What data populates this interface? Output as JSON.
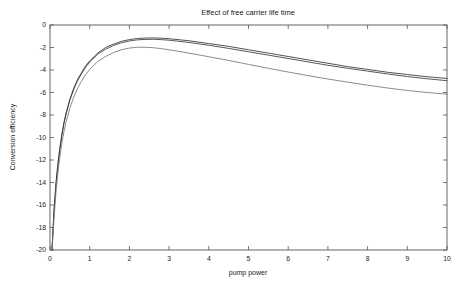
{
  "chart_data": {
    "type": "line",
    "title": "Effect of free carrier life time",
    "xlabel": "pump power",
    "ylabel": "Conversion efficiency",
    "xlim": [
      0,
      10
    ],
    "ylim": [
      -20,
      0
    ],
    "xticks": [
      0,
      1,
      2,
      3,
      4,
      5,
      6,
      7,
      8,
      9,
      10
    ],
    "yticks": [
      0,
      -2,
      -4,
      -6,
      -8,
      -10,
      -12,
      -14,
      -16,
      -18,
      -20
    ],
    "xticklabels": [
      "0",
      "1",
      "2",
      "3",
      "4",
      "5",
      "6",
      "7",
      "8",
      "9",
      "10"
    ],
    "yticklabels": [
      "0",
      "-2",
      "-4",
      "-6",
      "-8",
      "-10",
      "-12",
      "-14",
      "-16",
      "-18",
      "-20"
    ],
    "grid": false,
    "legend": false,
    "legend_position": "none",
    "background_color": "#ffffff",
    "frame_color": "#555555",
    "x": [
      0.05,
      0.1,
      0.15,
      0.2,
      0.25,
      0.3,
      0.35,
      0.4,
      0.5,
      0.6,
      0.7,
      0.8,
      0.9,
      1.0,
      1.2,
      1.4,
      1.6,
      1.8,
      2.0,
      2.2,
      2.4,
      2.6,
      2.8,
      3.0,
      3.5,
      4.0,
      4.5,
      5.0,
      5.5,
      6.0,
      6.5,
      7.0,
      7.5,
      8.0,
      8.5,
      9.0,
      9.5,
      10.0
    ],
    "series": [
      {
        "name": "curve-1",
        "color": "#333333",
        "values": [
          -20.0,
          -16.5,
          -14.1,
          -12.3,
          -10.9,
          -9.7,
          -8.7,
          -7.9,
          -6.6,
          -5.6,
          -4.8,
          -4.2,
          -3.6,
          -3.2,
          -2.5,
          -2.0,
          -1.7,
          -1.45,
          -1.3,
          -1.2,
          -1.16,
          -1.15,
          -1.17,
          -1.22,
          -1.4,
          -1.65,
          -1.9,
          -2.2,
          -2.5,
          -2.8,
          -3.1,
          -3.4,
          -3.7,
          -3.95,
          -4.2,
          -4.4,
          -4.6,
          -4.75
        ]
      },
      {
        "name": "curve-2",
        "color": "#3a3a3a",
        "values": [
          -20.0,
          -16.6,
          -14.2,
          -12.4,
          -11.0,
          -9.8,
          -8.8,
          -8.0,
          -6.7,
          -5.7,
          -4.9,
          -4.3,
          -3.75,
          -3.3,
          -2.6,
          -2.15,
          -1.82,
          -1.58,
          -1.42,
          -1.32,
          -1.28,
          -1.27,
          -1.3,
          -1.35,
          -1.55,
          -1.8,
          -2.08,
          -2.38,
          -2.68,
          -2.98,
          -3.28,
          -3.58,
          -3.85,
          -4.1,
          -4.35,
          -4.58,
          -4.78,
          -4.95
        ]
      },
      {
        "name": "curve-3",
        "color": "#777777",
        "values": [
          -20.0,
          -17.3,
          -14.9,
          -13.1,
          -11.7,
          -10.5,
          -9.5,
          -8.7,
          -7.4,
          -6.4,
          -5.6,
          -4.95,
          -4.4,
          -3.95,
          -3.25,
          -2.8,
          -2.45,
          -2.2,
          -2.05,
          -1.98,
          -1.98,
          -2.02,
          -2.1,
          -2.2,
          -2.5,
          -2.82,
          -3.15,
          -3.5,
          -3.85,
          -4.18,
          -4.5,
          -4.8,
          -5.08,
          -5.35,
          -5.6,
          -5.82,
          -6.0,
          -6.15
        ]
      }
    ]
  },
  "figure": {
    "title_text": "Effect of free carrier life time"
  }
}
